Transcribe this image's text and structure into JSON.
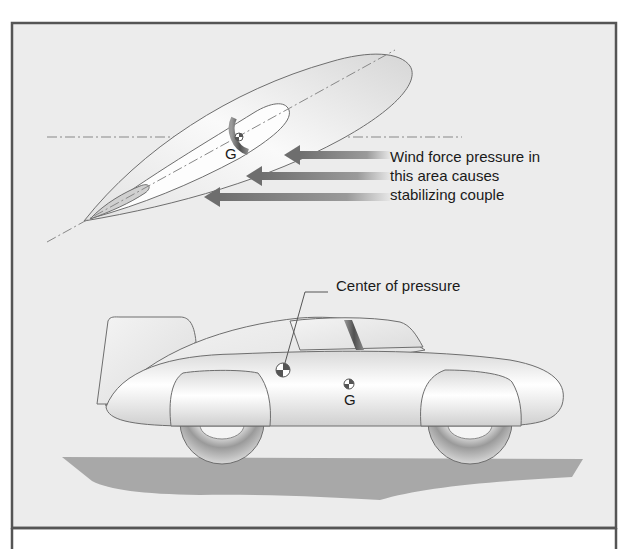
{
  "figure": {
    "top_view": {
      "g_label": "G",
      "annotation_lines": [
        "Wind force pressure in",
        "this area causes",
        "stabilizing couple"
      ],
      "arrow_count": 3
    },
    "side_view": {
      "callout": "Center of pressure",
      "g_label": "G"
    },
    "colors": {
      "background": "#ececec",
      "frame": "#555555",
      "body_outline": "#6e6e6e",
      "arrow": "#7a7a7a",
      "ground": "#a8a8a8"
    }
  }
}
